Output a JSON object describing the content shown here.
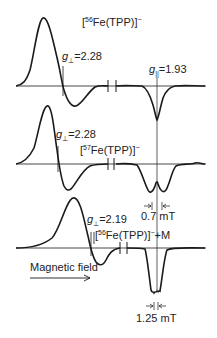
{
  "figure": {
    "type": "EPR spectra stack",
    "spectra": [
      {
        "label_prefix": "[",
        "isotope": "56",
        "label_body": "Fe(TPP)]",
        "charge": "−",
        "suffix": "",
        "g_perp_symbol": "g",
        "g_perp_sub": "⊥",
        "g_perp_value": "=2.28",
        "g_par_symbol": "g",
        "g_par_sub": "||",
        "g_par_value": "=1.93"
      },
      {
        "label_prefix": "[",
        "isotope": "57",
        "label_body": "Fe(TPP)]",
        "charge": "−",
        "suffix": "",
        "g_perp_symbol": "g",
        "g_perp_sub": "⊥",
        "g_perp_value": "=2.28",
        "splitting": "0.7 mT"
      },
      {
        "label_prefix": "[",
        "isotope": "56",
        "label_body": "Fe(TPP)]",
        "charge": "−",
        "suffix": "+M",
        "g_perp_symbol": "g",
        "g_perp_sub": "⊥",
        "g_perp_value": "=2.19",
        "splitting": "1.25 mT"
      }
    ],
    "axis_label": "Magnetic field",
    "stroke_color": "#1a1a1a"
  }
}
